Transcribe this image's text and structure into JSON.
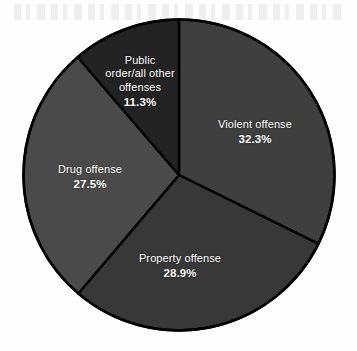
{
  "figure": {
    "background_color": "#fefefe",
    "outline_color": "#000000"
  },
  "chart_data": {
    "type": "pie",
    "title": "",
    "subtitle": "",
    "xlabel": "",
    "ylabel": "",
    "legend_position": "none",
    "grid": false,
    "labels_inside_slices": true,
    "start_angle_deg": 0,
    "direction": "clockwise",
    "categories": [
      "Violent offense",
      "Property offense",
      "Drug offense",
      "Public order/all other offenses"
    ],
    "values": [
      32.3,
      28.9,
      27.5,
      11.3
    ],
    "value_unit": "%",
    "total": 100.0,
    "slices": [
      {
        "label": "Violent offense",
        "label_line_1": "Violent offense",
        "value": 32.3,
        "value_text": "32.3%",
        "color": "#3f3f3f",
        "start_deg": 0.0,
        "end_deg": 116.28
      },
      {
        "label": "Property offense",
        "label_line_1": "Property offense",
        "value": 28.9,
        "value_text": "28.9%",
        "color": "#383838",
        "start_deg": 116.28,
        "end_deg": 220.32
      },
      {
        "label": "Drug offense",
        "label_line_1": "Drug offense",
        "value": 27.5,
        "value_text": "27.5%",
        "color": "#4a4a4a",
        "start_deg": 220.32,
        "end_deg": 319.32
      },
      {
        "label": "Public order/all other offenses",
        "label_line_1": "Public",
        "label_line_2": "order/all other",
        "label_line_3": "offenses",
        "value": 11.3,
        "value_text": "11.3%",
        "color": "#232323",
        "start_deg": 319.32,
        "end_deg": 360.0
      }
    ]
  }
}
